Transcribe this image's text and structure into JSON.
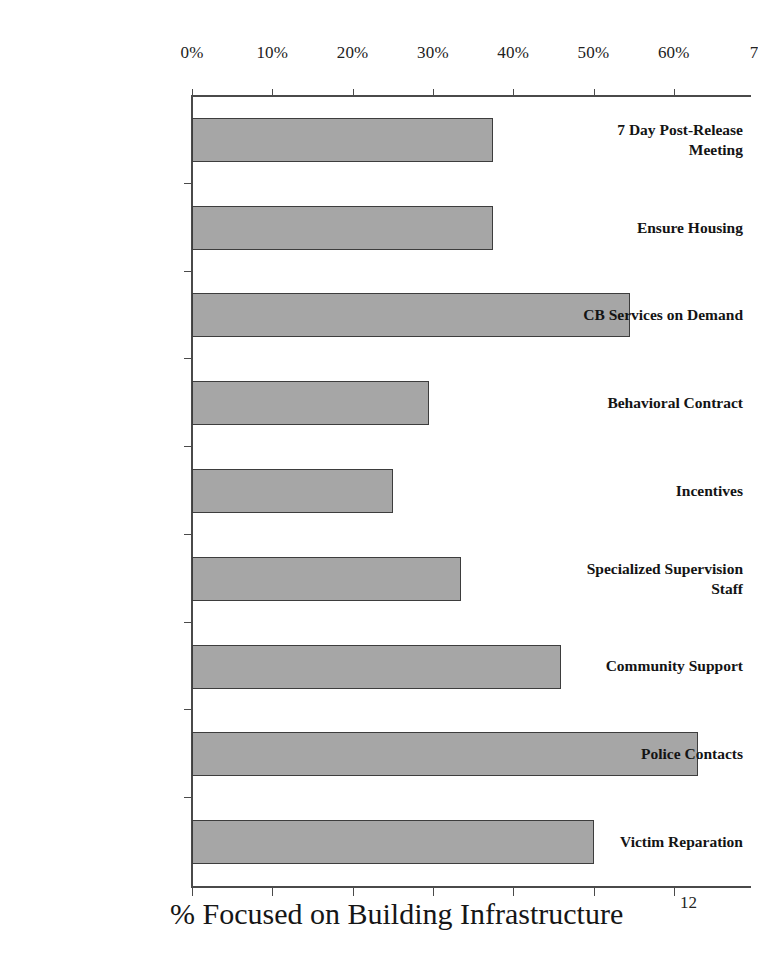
{
  "slide": {
    "page_number": "12",
    "title_fragment": ""
  },
  "chart_data": {
    "type": "bar",
    "orientation": "horizontal",
    "title": "",
    "xlabel": "% Focused on Building Infrastructure",
    "ylabel": "",
    "xlim": [
      0,
      70
    ],
    "grid": false,
    "legend": false,
    "bar_color": "#a6a6a6",
    "bar_border_color": "#3d3d3d",
    "axis_color": "#4a4a4a",
    "x_tick_labels": [
      "0%",
      "10%",
      "20%",
      "30%",
      "40%",
      "50%",
      "60%",
      "7"
    ],
    "x_tick_values": [
      0,
      10,
      20,
      30,
      40,
      50,
      60,
      70
    ],
    "categories": [
      "7 Day Post-Release\nMeeting",
      "Ensure Housing",
      "CB Services on Demand",
      "Behavioral Contract",
      "Incentives",
      "Specialized Supervision\nStaff",
      "Community Support",
      "Police Contacts",
      "Victim Reparation"
    ],
    "values": [
      37.5,
      37.5,
      54.5,
      29.5,
      25,
      33.5,
      46,
      63,
      50
    ]
  }
}
